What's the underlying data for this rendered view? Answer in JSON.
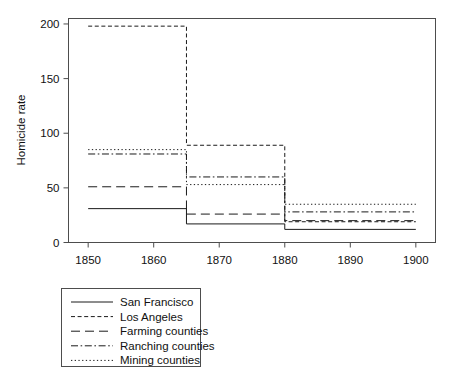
{
  "chart_data": {
    "type": "line",
    "title": "",
    "subtitle": "",
    "xlabel": "",
    "ylabel": "Homicide rate",
    "xlim": [
      1847,
      1903
    ],
    "ylim": [
      0,
      205
    ],
    "xticks": [
      "1850",
      "1860",
      "1870",
      "1880",
      "1890",
      "1900"
    ],
    "xtick_values": [
      1850,
      1860,
      1870,
      1880,
      1890,
      1900
    ],
    "yticks": [
      "0",
      "50",
      "100",
      "150",
      "200"
    ],
    "ytick_values": [
      0,
      50,
      100,
      150,
      200
    ],
    "grid": false,
    "step_style": "step-post",
    "x_breakpoints": [
      1850,
      1865,
      1880,
      1900
    ],
    "legend_position": "below-left",
    "series": [
      {
        "name": "San Francisco",
        "dash": "solid",
        "color": "#1a1a1a",
        "x": [
          1850,
          1865,
          1880,
          1900
        ],
        "values": [
          31,
          17,
          12,
          12
        ]
      },
      {
        "name": "Los Angeles",
        "dash": "short-dash",
        "color": "#1a1a1a",
        "x": [
          1850,
          1865,
          1880,
          1900
        ],
        "values": [
          198,
          89,
          19,
          19
        ]
      },
      {
        "name": "Farming counties",
        "dash": "long-dash",
        "color": "#1a1a1a",
        "x": [
          1850,
          1865,
          1880,
          1900
        ],
        "values": [
          51,
          26,
          20,
          20
        ]
      },
      {
        "name": "Ranching counties",
        "dash": "dash-dot",
        "color": "#1a1a1a",
        "x": [
          1850,
          1865,
          1880,
          1900
        ],
        "values": [
          81,
          60,
          28,
          28
        ]
      },
      {
        "name": "Mining counties",
        "dash": "dotted",
        "color": "#1a1a1a",
        "x": [
          1850,
          1865,
          1880,
          1900
        ],
        "values": [
          85,
          53,
          35,
          35
        ]
      }
    ]
  },
  "legend": {
    "items": [
      {
        "label": "San Francisco"
      },
      {
        "label": "Los Angeles"
      },
      {
        "label": "Farming counties"
      },
      {
        "label": "Ranching counties"
      },
      {
        "label": "Mining counties"
      }
    ]
  },
  "axes": {
    "y_title": "Homicide rate",
    "x_tick_labels": [
      "1850",
      "1860",
      "1870",
      "1880",
      "1890",
      "1900"
    ],
    "y_tick_labels": [
      "0",
      "50",
      "100",
      "150",
      "200"
    ]
  },
  "colors": {
    "line": "#1a1a1a",
    "frame": "#4d4d4d",
    "background": "#ffffff"
  }
}
